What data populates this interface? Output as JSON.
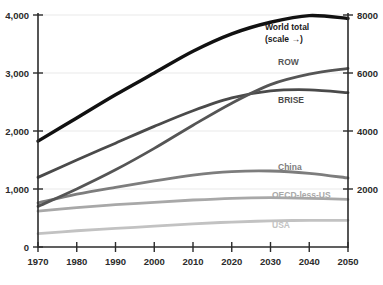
{
  "chart_data": {
    "type": "line",
    "title": "",
    "xlabel": "",
    "ylabel": "",
    "xlim": [
      1970,
      2050
    ],
    "ylim": [
      0,
      4000
    ],
    "y2lim": [
      0,
      8000
    ],
    "grid": true,
    "legend_position": "inline-right",
    "x": [
      1970,
      1980,
      1990,
      2000,
      2010,
      2020,
      2030,
      2040,
      2050
    ],
    "x_tick_labels": [
      "1970",
      "1980",
      "1990",
      "2000",
      "2010",
      "2020",
      "2030",
      "2040",
      "2050"
    ],
    "y_tick_labels": [
      "0",
      "1,000",
      "2,000",
      "3,000",
      "4,000"
    ],
    "y_tick_values": [
      0,
      1000,
      2000,
      3000,
      4000
    ],
    "y2_tick_labels": [
      "2000",
      "4000",
      "6000",
      "8000"
    ],
    "y2_tick_values": [
      2000,
      4000,
      6000,
      8000
    ],
    "series": [
      {
        "name": "World total",
        "sublabel": "(scale →)",
        "axis": "right",
        "color": "#111111",
        "width": 3.4,
        "values": [
          3650,
          4450,
          5250,
          6000,
          6750,
          7350,
          7750,
          7980,
          7880
        ]
      },
      {
        "name": "ROW",
        "axis": "left",
        "color": "#555555",
        "width": 2.8,
        "values": [
          700,
          1000,
          1330,
          1700,
          2100,
          2480,
          2800,
          2980,
          3080
        ]
      },
      {
        "name": "BRISE",
        "axis": "left",
        "color": "#4a4a4a",
        "width": 2.8,
        "values": [
          1200,
          1500,
          1790,
          2080,
          2350,
          2570,
          2690,
          2710,
          2660
        ]
      },
      {
        "name": "China",
        "axis": "left",
        "color": "#7d7d7d",
        "width": 2.8,
        "values": [
          760,
          910,
          1030,
          1140,
          1240,
          1300,
          1310,
          1270,
          1190
        ]
      },
      {
        "name": "OECD-less-US",
        "axis": "left",
        "color": "#a8a8a8",
        "width": 2.8,
        "values": [
          620,
          680,
          730,
          770,
          810,
          840,
          850,
          840,
          820
        ]
      },
      {
        "name": "USA",
        "axis": "left",
        "color": "#c2c2c2",
        "width": 2.8,
        "values": [
          230,
          280,
          320,
          360,
          400,
          430,
          450,
          460,
          460
        ]
      }
    ],
    "annotations": [
      {
        "text": "World total",
        "x": 2032,
        "y2": 7350,
        "bold": true
      },
      {
        "text": "(scale →)",
        "x": 2032,
        "y2": 6900,
        "bold": true
      },
      {
        "text": "ROW",
        "x": 2034,
        "y": 2960,
        "bold": true
      },
      {
        "text": "BRISE",
        "x": 2036,
        "y": 2420,
        "bold": true
      },
      {
        "text": "China",
        "x": 2032,
        "y": 1450,
        "bold": true
      },
      {
        "text": "OECD-less-US",
        "x": 2031,
        "y": 1030,
        "bold": true
      },
      {
        "text": "USA",
        "x": 2031,
        "y": 640,
        "bold": true
      }
    ]
  },
  "labels": {
    "world_total": "World total",
    "world_total_scale": "(scale →)",
    "row": "ROW",
    "brise": "BRISE",
    "china": "China",
    "oecd_less_us": "OECD-less-US",
    "usa": "USA"
  },
  "y_axis_left": {
    "t0": "0",
    "t1": "1,000",
    "t2": "2,000",
    "t3": "3,000",
    "t4": "4,000"
  },
  "y_axis_right": {
    "t1": "2000",
    "t2": "4000",
    "t3": "6000",
    "t4": "8000"
  },
  "x_axis": {
    "t0": "1970",
    "t1": "1980",
    "t2": "1990",
    "t3": "2000",
    "t4": "2010",
    "t5": "2020",
    "t6": "2030",
    "t7": "2040",
    "t8": "2050"
  },
  "colors": {
    "world_total": "#111111",
    "row": "#555555",
    "brise": "#4a4a4a",
    "china": "#7d7d7d",
    "oecd_less_us": "#a8a8a8",
    "usa": "#c2c2c2",
    "axis": "#2b2b2b",
    "grid": "#e9e9e9",
    "background": "#ffffff"
  }
}
